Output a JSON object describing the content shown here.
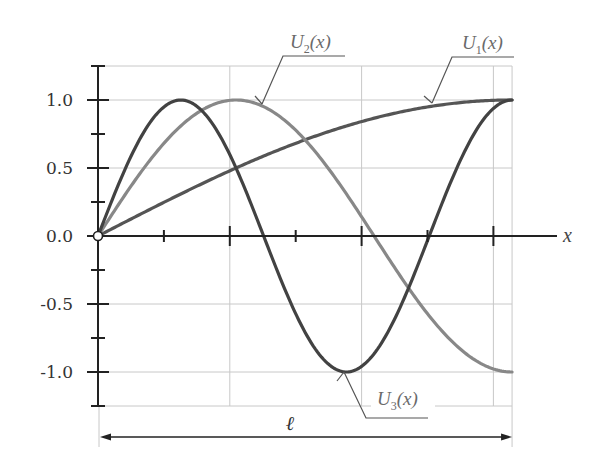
{
  "chart_data": {
    "type": "line",
    "title": "",
    "xlabel": "x",
    "ylabel": "",
    "dimension_label": "ℓ",
    "xlim": [
      0,
      6.2832
    ],
    "ylim": [
      -1.25,
      1.25
    ],
    "x_ticks": [
      1,
      2,
      3,
      4,
      5,
      6
    ],
    "x_major_ticks": [
      2,
      4,
      6
    ],
    "x_tick_labels_visible": false,
    "y_ticks": [
      -1.0,
      -0.5,
      0.0,
      0.5,
      1.0
    ],
    "y_minor_ticks": [
      -1.25,
      -0.75,
      -0.25,
      0.25,
      0.75,
      1.25
    ],
    "y_tick_labels": [
      "-1.0",
      "-0.5",
      "0.0",
      "0.5",
      "1.0"
    ],
    "grid": true,
    "origin_marker": "open-circle",
    "series": [
      {
        "name": "U1(x)",
        "label_main": "U",
        "label_sub": "1",
        "label_arg": "(x)",
        "function": "sin(x/4)",
        "color": "#555555",
        "x": [
          0,
          0.5,
          1,
          1.5,
          2,
          2.5,
          3,
          3.5,
          4,
          4.5,
          5,
          5.5,
          6,
          6.2832
        ],
        "y": [
          0,
          0.125,
          0.247,
          0.366,
          0.479,
          0.585,
          0.682,
          0.769,
          0.841,
          0.902,
          0.949,
          0.98,
          0.997,
          1.0
        ]
      },
      {
        "name": "U2(x)",
        "label_main": "U",
        "label_sub": "2",
        "label_arg": "(x)",
        "function": "sin(3x/4)",
        "color": "#888888",
        "x": [
          0,
          0.5,
          1,
          1.5,
          2,
          2.5,
          3,
          3.5,
          4,
          4.5,
          5,
          5.5,
          6,
          6.2832
        ],
        "y": [
          0,
          0.366,
          0.682,
          0.902,
          0.997,
          0.955,
          0.778,
          0.494,
          0.141,
          -0.228,
          -0.572,
          -0.842,
          -0.978,
          -1.0
        ]
      },
      {
        "name": "U3(x)",
        "label_main": "U",
        "label_sub": "3",
        "label_arg": "(x)",
        "function": "sin(5x/4)",
        "color": "#424242",
        "x": [
          0,
          0.5,
          1,
          1.5,
          2,
          2.5,
          3,
          3.5,
          4,
          4.5,
          5,
          5.5,
          6,
          6.2832
        ],
        "y": [
          0,
          0.585,
          0.949,
          0.955,
          0.598,
          0.016,
          -0.572,
          -0.946,
          -0.959,
          -0.61,
          -0.033,
          0.558,
          0.938,
          1.0
        ]
      }
    ]
  }
}
